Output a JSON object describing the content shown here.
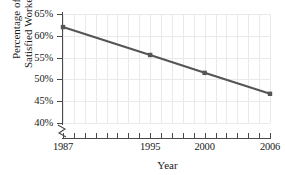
{
  "chart_data": {
    "type": "line",
    "title": "",
    "xlabel": "Year",
    "ylabel_line1": "Percentage of",
    "ylabel_line2": "Satisfied Workers",
    "x": [
      1987,
      1995,
      2000,
      2006
    ],
    "x_tick_labels": [
      "1987",
      "1995",
      "2000",
      "2006"
    ],
    "y_tick_labels": [
      "65%",
      "60%",
      "55%",
      "50%",
      "45%",
      "40%"
    ],
    "y_ticks": [
      65,
      60,
      55,
      50,
      45,
      40
    ],
    "values": [
      62.0,
      55.6,
      51.5,
      46.7
    ],
    "series": [
      {
        "name": "Percentage of Satisfied Workers",
        "values": [
          62.0,
          55.6,
          51.5,
          46.7
        ]
      }
    ],
    "xlim": [
      1987,
      2006
    ],
    "ylim": [
      40,
      65
    ],
    "grid": true,
    "legend": "none",
    "axis_break": true,
    "line_color": "#555555",
    "marker_color": "#555555",
    "grid_color": "#e9e9ec",
    "axis_color": "#4a4a4a",
    "minor_x_ticks": [
      1988,
      1989,
      1990,
      1991,
      1992,
      1993,
      1994,
      1996,
      1997,
      1998,
      1999,
      2001,
      2002,
      2003,
      2004,
      2005
    ]
  }
}
